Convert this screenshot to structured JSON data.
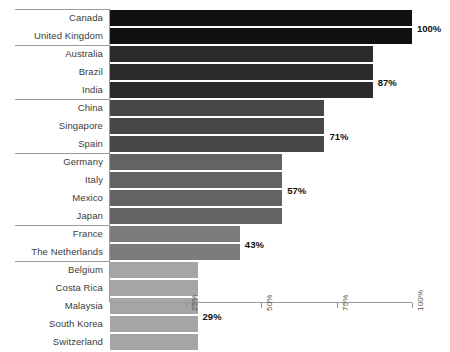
{
  "chart_data": {
    "type": "bar",
    "orientation": "horizontal",
    "title": "",
    "subtitle": "",
    "xlabel": "",
    "ylabel": "",
    "xlim": [
      0,
      107
    ],
    "grid": false,
    "legend": null,
    "categories": [
      "Canada",
      "United Kingdom",
      "Australia",
      "Brazil",
      "India",
      "China",
      "Singapore",
      "Spain",
      "Germany",
      "Italy",
      "Mexico",
      "Japan",
      "France",
      "The Netherlands",
      "Belgium",
      "Costa Rica",
      "Malaysia",
      "South Korea",
      "Switzerland"
    ],
    "values": [
      100,
      100,
      87,
      87,
      87,
      71,
      71,
      71,
      57,
      57,
      57,
      57,
      43,
      43,
      29,
      29,
      29,
      29,
      29
    ],
    "bar_colors": [
      "#111111",
      "#111111",
      "#2b2b2b",
      "#2b2b2b",
      "#2b2b2b",
      "#474747",
      "#474747",
      "#474747",
      "#636363",
      "#636363",
      "#636363",
      "#636363",
      "#7c7c7c",
      "#7c7c7c",
      "#a5a5a5",
      "#a5a5a5",
      "#a5a5a5",
      "#a5a5a5",
      "#a5a5a5"
    ],
    "annotations": [
      {
        "text": "100%",
        "value": 100,
        "row_index": 0
      },
      {
        "text": "87%",
        "value": 87,
        "row_index": 3
      },
      {
        "text": "71%",
        "value": 71,
        "row_index": 6
      },
      {
        "text": "57%",
        "value": 57,
        "row_index": 9
      },
      {
        "text": "43%",
        "value": 43,
        "row_index": 12
      },
      {
        "text": "29%",
        "value": 29,
        "row_index": 16
      }
    ],
    "xticks": [
      25,
      50,
      75,
      100
    ],
    "xticklabels": [
      "25%",
      "50%",
      "75%",
      "100%"
    ],
    "group_breaks": [
      0,
      2,
      5,
      8,
      12,
      14
    ]
  },
  "style": {
    "background": "#ffffff",
    "rule_color": "#9a9a9a",
    "label_color": "#3b3b3b",
    "annotation_color": "#111111",
    "tick_label_color": "#555555"
  }
}
